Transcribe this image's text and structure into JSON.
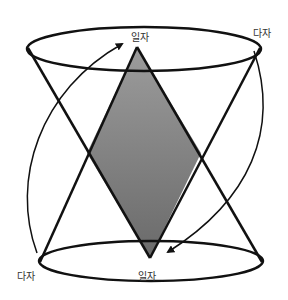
{
  "diagram": {
    "labels": {
      "top_single": "일자",
      "bottom_single": "일자",
      "top_right_multi": "다자",
      "bottom_left_multi": "다자"
    },
    "colors": {
      "stroke": "#111111",
      "fill_top": "#9a9a9a",
      "fill_bottom": "#6e6e6e"
    }
  }
}
